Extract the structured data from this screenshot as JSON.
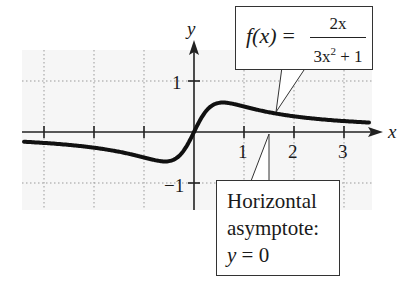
{
  "chart_data": {
    "type": "line",
    "title": "",
    "function": "f(x) = 2x / (3x^2 + 1)",
    "xlabel": "x",
    "ylabel": "y",
    "xlim": [
      -3.4,
      3.5
    ],
    "ylim": [
      -1.5,
      1.6
    ],
    "x_ticks": [
      -3,
      -2,
      -1,
      1,
      2,
      3
    ],
    "x_tick_labels": [
      "",
      "",
      "",
      "1",
      "2",
      "3"
    ],
    "y_ticks": [
      -1,
      1
    ],
    "y_tick_labels": [
      "−1",
      "1"
    ],
    "grid": true,
    "grid_style": "dotted",
    "series": [
      {
        "name": "f(x) = 2x/(3x²+1)",
        "x": [
          -3.4,
          -3,
          -2.5,
          -2,
          -1.5,
          -1,
          -0.8,
          -0.577,
          -0.4,
          -0.2,
          0,
          0.2,
          0.4,
          0.577,
          0.8,
          1,
          1.5,
          2,
          2.5,
          3,
          3.5
        ],
        "y": [
          -0.19,
          -0.214,
          -0.253,
          -0.308,
          -0.387,
          -0.5,
          -0.541,
          -0.577,
          -0.541,
          -0.352,
          0,
          0.352,
          0.541,
          0.577,
          0.541,
          0.5,
          0.387,
          0.308,
          0.253,
          0.214,
          0.186
        ]
      }
    ],
    "annotations": [
      {
        "text": "f(x) = 2x / (3x² + 1)",
        "points_to": [
          1.6,
          0.38
        ]
      },
      {
        "text": "Horizontal asymptote: y = 0",
        "points_to": [
          1.5,
          0
        ]
      }
    ]
  },
  "axes": {
    "x_label": "x",
    "y_label": "y",
    "x_tick_labels": [
      {
        "value": 1,
        "label": "1"
      },
      {
        "value": 2,
        "label": "2"
      },
      {
        "value": 3,
        "label": "3"
      }
    ],
    "y_tick_labels": [
      {
        "value": 1,
        "label": "1"
      },
      {
        "value": -1,
        "label": "−1"
      }
    ]
  },
  "formula_callout": {
    "lhs": "f(x)",
    "equals": "=",
    "numerator": "2x",
    "denominator_base": "3x",
    "denominator_exp": "2",
    "denominator_rest": " + 1"
  },
  "asymptote_callout": {
    "line1": "Horizontal",
    "line2": "asymptote:",
    "line3_var": "y",
    "line3_rest": " = 0"
  },
  "colors": {
    "curve": "#111111",
    "axes": "#222222",
    "grid": "#9a9a9a",
    "plot_bg": "#f6f6f6"
  }
}
